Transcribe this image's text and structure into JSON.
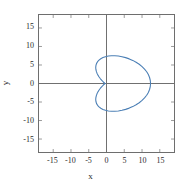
{
  "chart_data": {
    "type": "line",
    "title": "",
    "xlabel": "x",
    "ylabel": "y",
    "xlim": [
      -19,
      19
    ],
    "ylim": [
      -18.5,
      18.5
    ],
    "xticks": [
      -15,
      -10,
      -5,
      0,
      5,
      10,
      15
    ],
    "xtick_labels": [
      "-15",
      "-10",
      "-5",
      "0",
      "5",
      "10",
      "15"
    ],
    "yticks": [
      15,
      10,
      5,
      0,
      -5,
      -10,
      -15
    ],
    "ytick_labels": [
      "15",
      "10",
      "5",
      "0",
      "-5",
      "-10",
      "-15"
    ],
    "grid": false,
    "legend": null,
    "axis_lines": {
      "x_axis_at_y": 0,
      "y_axis_at_x": 0,
      "color": "#6e6e6e"
    },
    "series": [
      {
        "name": "cardioid",
        "type": "polar-curve",
        "equation": "r = 6.2 (1 + cos(theta))",
        "color": "#4b7fb5",
        "linewidth": 1.1,
        "closed": true,
        "x_range": [
          -1.0,
          12.4
        ],
        "y_range": [
          -10.0,
          10.0
        ],
        "points": [
          [
            12.4,
            0.0
          ],
          [
            12.33,
            0.81
          ],
          [
            12.12,
            1.62
          ],
          [
            11.78,
            2.41
          ],
          [
            11.31,
            3.17
          ],
          [
            10.71,
            3.89
          ],
          [
            10.01,
            4.57
          ],
          [
            9.21,
            5.19
          ],
          [
            8.33,
            5.75
          ],
          [
            7.39,
            6.24
          ],
          [
            6.4,
            6.65
          ],
          [
            5.38,
            6.99
          ],
          [
            4.36,
            7.24
          ],
          [
            3.34,
            7.41
          ],
          [
            2.35,
            7.49
          ],
          [
            1.4,
            7.49
          ],
          [
            0.52,
            7.41
          ],
          [
            -0.29,
            7.24
          ],
          [
            -1.0,
            7.0
          ],
          [
            -1.61,
            6.69
          ],
          [
            -2.11,
            6.32
          ],
          [
            -2.51,
            5.9
          ],
          [
            -2.79,
            5.43
          ],
          [
            -2.96,
            4.93
          ],
          [
            -3.03,
            4.41
          ],
          [
            -3.0,
            3.87
          ],
          [
            -2.88,
            3.33
          ],
          [
            -2.68,
            2.79
          ],
          [
            -2.41,
            2.26
          ],
          [
            -2.08,
            1.75
          ],
          [
            -1.71,
            1.27
          ],
          [
            -1.31,
            0.82
          ],
          [
            -0.9,
            0.41
          ],
          [
            -0.49,
            0.07
          ],
          [
            -0.3,
            0.0
          ],
          [
            -0.49,
            -0.07
          ],
          [
            -0.9,
            -0.41
          ],
          [
            -1.31,
            -0.82
          ],
          [
            -1.71,
            -1.27
          ],
          [
            -2.08,
            -1.75
          ],
          [
            -2.41,
            -2.26
          ],
          [
            -2.68,
            -2.79
          ],
          [
            -2.88,
            -3.33
          ],
          [
            -3.0,
            -3.87
          ],
          [
            -3.03,
            -4.41
          ],
          [
            -2.96,
            -4.93
          ],
          [
            -2.79,
            -5.43
          ],
          [
            -2.51,
            -5.9
          ],
          [
            -2.11,
            -6.32
          ],
          [
            -1.61,
            -6.69
          ],
          [
            -1.0,
            -7.0
          ],
          [
            -0.29,
            -7.24
          ],
          [
            0.52,
            -7.41
          ],
          [
            1.4,
            -7.49
          ],
          [
            2.35,
            -7.49
          ],
          [
            3.34,
            -7.41
          ],
          [
            4.36,
            -7.24
          ],
          [
            5.38,
            -6.99
          ],
          [
            6.4,
            -6.65
          ],
          [
            7.39,
            -6.24
          ],
          [
            8.33,
            -5.75
          ],
          [
            9.21,
            -5.19
          ],
          [
            10.01,
            -4.57
          ],
          [
            10.71,
            -3.89
          ],
          [
            11.31,
            -3.17
          ],
          [
            11.78,
            -2.41
          ],
          [
            12.12,
            -1.62
          ],
          [
            12.33,
            -0.81
          ],
          [
            12.4,
            0.0
          ]
        ]
      }
    ]
  },
  "axes": {
    "x_title": "x",
    "y_title": "y"
  }
}
